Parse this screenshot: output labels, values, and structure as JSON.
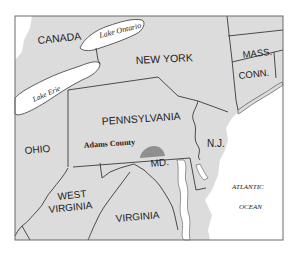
{
  "map": {
    "title": "Pennsylvania and surrounding states",
    "highlight": {
      "label": "Adams County",
      "color": "#8f8f8f"
    },
    "colors": {
      "land": "#dcdcdc",
      "water": "#ffffff",
      "border": "#3a3a3a",
      "frame": "#6a6a6a"
    },
    "labels": {
      "canada": "CANADA",
      "lake_ontario": "Lake Ontario",
      "lake_erie": "Lake Erie",
      "new_york": "NEW YORK",
      "mass": "MASS.",
      "conn": "CONN.",
      "pennsylvania": "PENNSYLVANIA",
      "adams_county": "Adams County",
      "ohio": "OHIO",
      "nj": "N.J.",
      "md": "MD.",
      "west_virginia_1": "WEST",
      "west_virginia_2": "VIRGINIA",
      "virginia": "VIRGINIA",
      "atlantic_1": "ATLANTIC",
      "atlantic_2": "OCEAN"
    }
  }
}
